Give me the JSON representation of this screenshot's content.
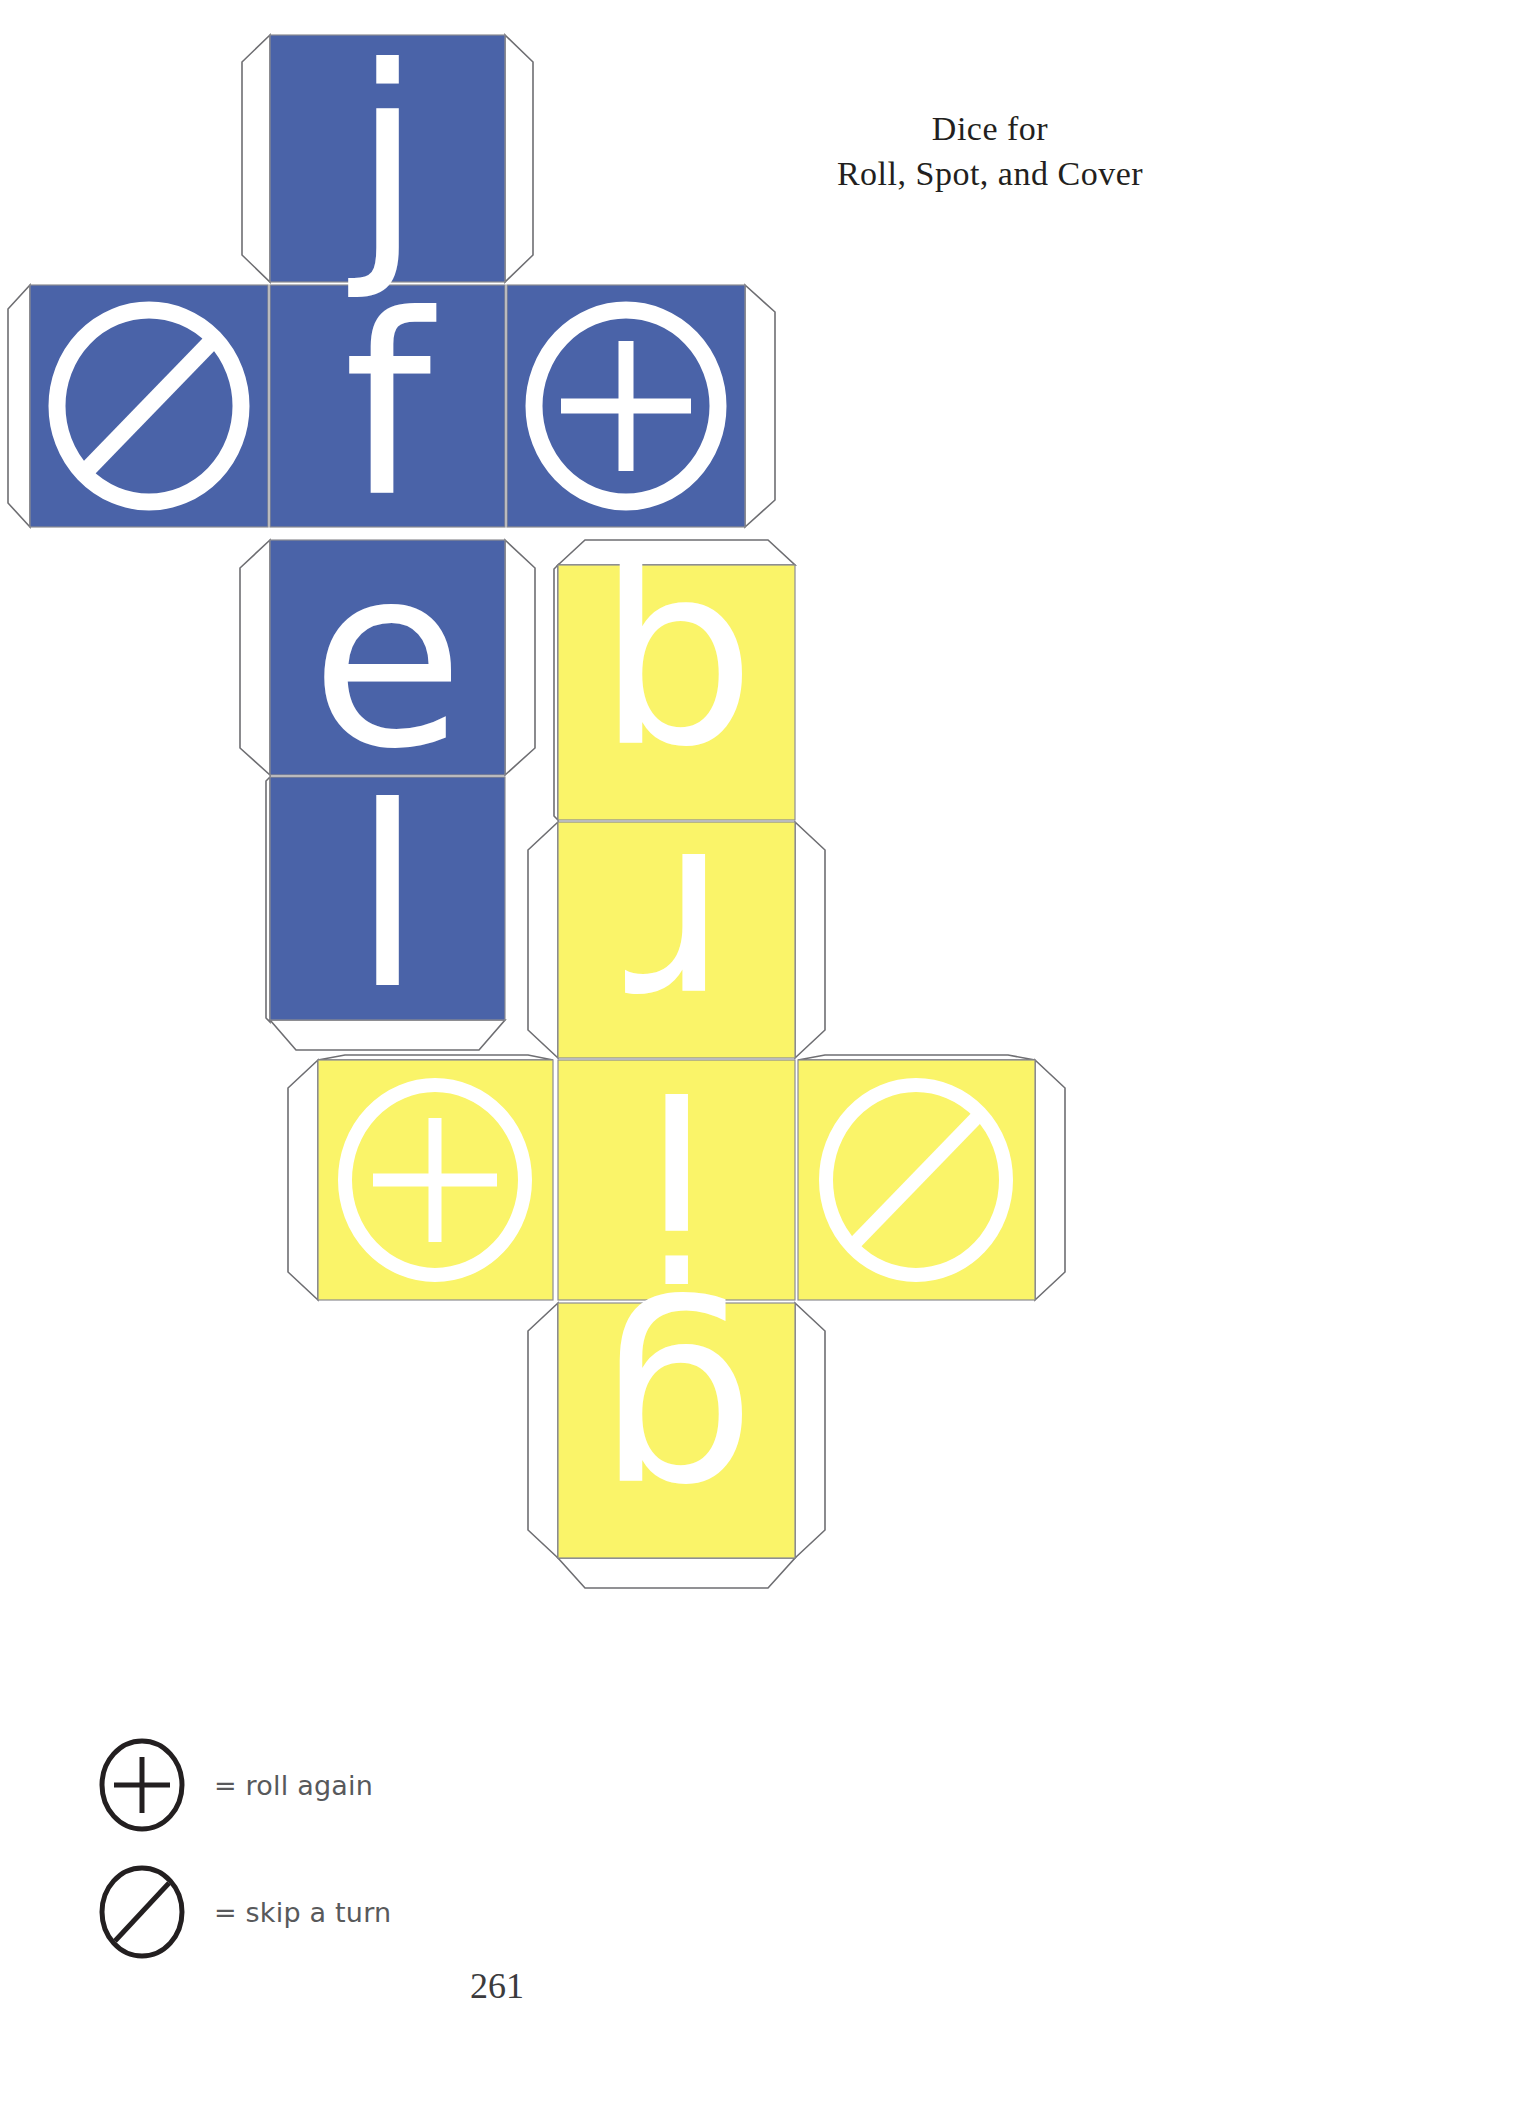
{
  "page": {
    "number": "261",
    "background_color": "#ffffff"
  },
  "header": {
    "title_line1": "Dice for",
    "title_line2": "Roll, Spot, and Cover"
  },
  "colors": {
    "blue_die": "#4a63a8",
    "yellow_die": "#faf469",
    "glyph": "#ffffff",
    "cut_line": "#6e6e72",
    "legend_text": "#58595b"
  },
  "dice": [
    {
      "id": "blue-die",
      "name": "blue-die-net",
      "color": "#4a63a8",
      "faces": [
        {
          "slot": "top",
          "kind": "letter",
          "value": "j",
          "rotated": false
        },
        {
          "slot": "middle-left",
          "kind": "symbol",
          "value": "skip-a-turn",
          "rotated": false
        },
        {
          "slot": "middle-center",
          "kind": "letter",
          "value": "f",
          "rotated": false
        },
        {
          "slot": "middle-right",
          "kind": "symbol",
          "value": "roll-again",
          "rotated": false
        },
        {
          "slot": "lower",
          "kind": "letter",
          "value": "e",
          "rotated": false
        },
        {
          "slot": "bottom",
          "kind": "letter",
          "value": "l",
          "rotated": false
        }
      ]
    },
    {
      "id": "yellow-die",
      "name": "yellow-die-net",
      "color": "#faf469",
      "faces": [
        {
          "slot": "top",
          "kind": "letter",
          "value": "q",
          "rotated": true
        },
        {
          "slot": "upper",
          "kind": "letter",
          "value": "r",
          "rotated": true
        },
        {
          "slot": "middle-left",
          "kind": "symbol",
          "value": "roll-again",
          "rotated": false
        },
        {
          "slot": "middle-center",
          "kind": "letter",
          "value": "i",
          "rotated": true
        },
        {
          "slot": "middle-right",
          "kind": "symbol",
          "value": "skip-a-turn",
          "rotated": false
        },
        {
          "slot": "bottom",
          "kind": "letter",
          "value": "g",
          "rotated": true
        }
      ]
    }
  ],
  "legend": {
    "items": [
      {
        "icon": "roll-again-icon",
        "label": "= roll again"
      },
      {
        "icon": "skip-a-turn-icon",
        "label": "= skip a turn"
      }
    ]
  }
}
